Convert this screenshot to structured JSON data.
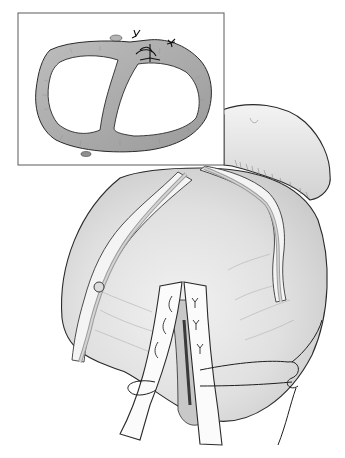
{
  "illustration": {
    "background": "#ffffff",
    "stroke_color": "#2a2a2a",
    "tissue_fill": "#e6e6e6",
    "tissue_shadow": "#c4c4c4",
    "wall_fill": "#a9a9a9",
    "wall_light": "#cfcfcf",
    "fat_fill": "#f4f4f4",
    "vessel_fill": "#bdbdbd",
    "flap_fill": "#fbfbfb",
    "lumen_dark": "#3a3a3a"
  },
  "inset": {
    "x": 18,
    "y": 13,
    "width": 206,
    "height": 152,
    "border_color": "#5a5a5a",
    "background": "#ffffff"
  }
}
